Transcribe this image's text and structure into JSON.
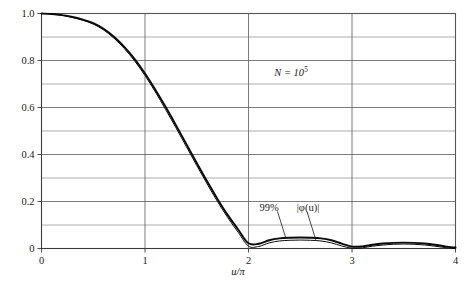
{
  "chart_data": {
    "type": "line",
    "title": "",
    "xlabel": "u/π",
    "ylabel": "",
    "xlim": [
      0,
      4
    ],
    "ylim": [
      0,
      1.0
    ],
    "grid": true,
    "legend_position": "inline-annotation",
    "x_ticks": [
      "0",
      "1",
      "2",
      "3",
      "4"
    ],
    "x_tick_values": [
      0,
      1,
      2,
      3,
      4
    ],
    "y_ticks": [
      "0",
      "0.2",
      "0.4",
      "0.6",
      "0.8",
      "1.0"
    ],
    "y_tick_values": [
      0,
      0.2,
      0.4,
      0.6,
      0.8,
      1.0
    ],
    "y_minor_gridlines": [
      0.1,
      0.3,
      0.5,
      0.7,
      0.9
    ],
    "annotations": [
      {
        "name": "sample-size",
        "text": "N = 10⁵",
        "symbol": "N",
        "relation": "=",
        "base": "10",
        "exponent": "5",
        "x": 2.0,
        "y": 0.72
      },
      {
        "name": "curve-label-99pct",
        "text": "99%",
        "x": 2.33,
        "y": 0.155
      },
      {
        "name": "curve-label-phi",
        "text": "|φ(u)|",
        "x": 2.75,
        "y": 0.155
      }
    ],
    "series": [
      {
        "name": "|φ(u)|",
        "label": "|φ(u)|",
        "color": "#0a0a0a",
        "x": [
          0,
          0.1,
          0.2,
          0.3,
          0.4,
          0.5,
          0.6,
          0.7,
          0.8,
          0.9,
          1.0,
          1.1,
          1.2,
          1.3,
          1.4,
          1.5,
          1.6,
          1.7,
          1.8,
          1.9,
          2.0,
          2.1,
          2.2,
          2.3,
          2.4,
          2.5,
          2.6,
          2.7,
          2.8,
          2.9,
          3.0,
          3.1,
          3.2,
          3.3,
          3.4,
          3.5,
          3.6,
          3.7,
          3.8,
          3.9,
          4.0
        ],
        "y": [
          1.0,
          0.998,
          0.993,
          0.985,
          0.974,
          0.959,
          0.935,
          0.901,
          0.858,
          0.806,
          0.745,
          0.676,
          0.602,
          0.524,
          0.444,
          0.364,
          0.286,
          0.211,
          0.142,
          0.081,
          0.022,
          0.02,
          0.035,
          0.043,
          0.046,
          0.047,
          0.046,
          0.043,
          0.035,
          0.021,
          0.008,
          0.009,
          0.016,
          0.021,
          0.024,
          0.025,
          0.024,
          0.021,
          0.016,
          0.009,
          0.004
        ]
      },
      {
        "name": "99%",
        "label": "99%",
        "color": "#0a0a0a",
        "x": [
          0,
          0.1,
          0.2,
          0.3,
          0.4,
          0.5,
          0.6,
          0.7,
          0.8,
          0.9,
          1.0,
          1.1,
          1.2,
          1.3,
          1.4,
          1.5,
          1.6,
          1.7,
          1.8,
          1.9,
          2.0,
          2.1,
          2.2,
          2.3,
          2.4,
          2.5,
          2.6,
          2.7,
          2.8,
          2.9,
          3.0,
          3.1,
          3.2,
          3.3,
          3.4,
          3.5,
          3.6,
          3.7,
          3.8,
          3.9,
          4.0
        ],
        "y": [
          1.0,
          0.998,
          0.992,
          0.983,
          0.971,
          0.955,
          0.93,
          0.895,
          0.851,
          0.798,
          0.736,
          0.666,
          0.591,
          0.513,
          0.433,
          0.353,
          0.275,
          0.2,
          0.131,
          0.069,
          0.01,
          0.009,
          0.024,
          0.032,
          0.035,
          0.036,
          0.035,
          0.032,
          0.024,
          0.011,
          0.001,
          0.003,
          0.01,
          0.015,
          0.018,
          0.019,
          0.018,
          0.015,
          0.01,
          0.004,
          0.0
        ]
      }
    ]
  }
}
